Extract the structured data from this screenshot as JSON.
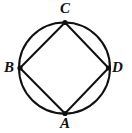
{
  "figure": {
    "background_color": "#ffffff",
    "stroke_color": "#111111",
    "circle": {
      "name": "circumscribed-circle",
      "cx": 64.5,
      "cy": 68.0,
      "r": 45.5,
      "stroke_width": 2.0,
      "fill": "none"
    },
    "vertices": [
      {
        "label": "C",
        "x": 65.0,
        "y": 22.5,
        "position": "top",
        "dot_radius": 2.6
      },
      {
        "label": "B",
        "x": 20.0,
        "y": 68.0,
        "position": "left",
        "dot_radius": 2.6
      },
      {
        "label": "D",
        "x": 108.5,
        "y": 68.0,
        "position": "right",
        "dot_radius": 2.6
      },
      {
        "label": "A",
        "x": 65.0,
        "y": 113.5,
        "position": "bottom",
        "dot_radius": 2.6
      }
    ],
    "edges": [
      {
        "name": "edge-BC",
        "from": "B",
        "to": "C"
      },
      {
        "name": "edge-CD",
        "from": "C",
        "to": "D"
      },
      {
        "name": "edge-DA",
        "from": "D",
        "to": "A"
      },
      {
        "name": "edge-AB",
        "from": "A",
        "to": "B"
      }
    ],
    "edge_stroke_width": 2.0,
    "labels": {
      "C": "C",
      "B": "B",
      "D": "D",
      "A": "A"
    }
  }
}
